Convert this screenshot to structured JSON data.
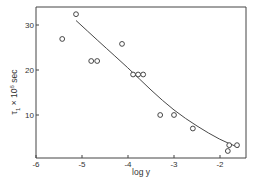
{
  "chart_data": {
    "type": "scatter",
    "title": "",
    "xlabel": "log y",
    "ylabel": "τ₁ × 10⁶ sec",
    "xlim": [
      -6,
      -1.5
    ],
    "ylim": [
      0,
      34
    ],
    "xticks": [
      -6,
      -5,
      -4,
      -3,
      -2
    ],
    "xtick_labels": [
      "-6",
      "-5",
      "-4",
      "-3",
      "-2"
    ],
    "yticks": [
      10,
      20,
      30
    ],
    "ytick_labels": [
      "10",
      "20",
      "30"
    ],
    "grid": false,
    "legend": null,
    "series": [
      {
        "name": "measured",
        "marker": "open-circle",
        "points": [
          {
            "x": -5.43,
            "y": 26.9
          },
          {
            "x": -5.13,
            "y": 32.4
          },
          {
            "x": -4.8,
            "y": 22.0
          },
          {
            "x": -4.67,
            "y": 22.0
          },
          {
            "x": -4.13,
            "y": 25.8
          },
          {
            "x": -3.89,
            "y": 19.0
          },
          {
            "x": -3.78,
            "y": 19.0
          },
          {
            "x": -3.67,
            "y": 19.0
          },
          {
            "x": -3.3,
            "y": 10.0
          },
          {
            "x": -3.0,
            "y": 10.0
          },
          {
            "x": -2.59,
            "y": 7.0
          },
          {
            "x": -1.8,
            "y": 3.3
          },
          {
            "x": -1.83,
            "y": 2.0
          },
          {
            "x": -1.63,
            "y": 3.3
          }
        ]
      },
      {
        "name": "fit",
        "style": "line",
        "points": [
          {
            "x": -5.13,
            "y": 31.0
          },
          {
            "x": -4.6,
            "y": 26.0
          },
          {
            "x": -4.0,
            "y": 20.5
          },
          {
            "x": -3.5,
            "y": 15.5
          },
          {
            "x": -3.0,
            "y": 11.0
          },
          {
            "x": -2.5,
            "y": 7.5
          },
          {
            "x": -2.0,
            "y": 4.5
          },
          {
            "x": -1.6,
            "y": 2.8
          }
        ]
      }
    ]
  }
}
